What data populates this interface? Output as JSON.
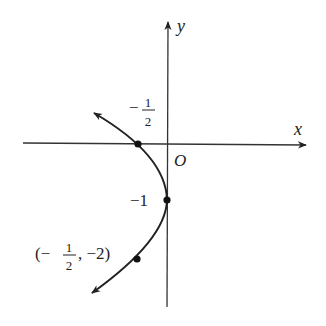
{
  "diagram": {
    "type": "parabola-graph",
    "equation_implied": "x = -1/2 (y + 1)^2",
    "axes": {
      "x_label": "x",
      "y_label": "y",
      "origin_label": "O"
    },
    "points": [
      {
        "name": "x-intercept",
        "coords": [
          -0.5,
          0
        ],
        "label_num": "1",
        "label_den": "2",
        "label_sign": "−"
      },
      {
        "name": "vertex",
        "coords": [
          0,
          -1
        ],
        "label": "−1"
      },
      {
        "name": "point",
        "coords": [
          -0.5,
          -2
        ],
        "label_open": "(−",
        "label_num": "1",
        "label_den": "2",
        "label_rest": ", −2)"
      }
    ],
    "colors": {
      "ink": "#222222",
      "background": "#ffffff"
    }
  }
}
